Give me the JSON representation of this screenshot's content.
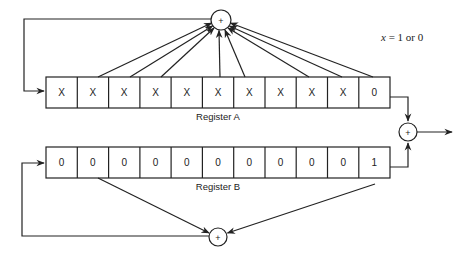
{
  "diagram": {
    "legend": {
      "variable": "x",
      "text": " = 1 or 0"
    },
    "register_a": {
      "label": "Register A",
      "cells": [
        "X",
        "X",
        "X",
        "X",
        "X",
        "X",
        "X",
        "X",
        "X",
        "X",
        "0"
      ]
    },
    "register_b": {
      "label": "Register B",
      "cells": [
        "0",
        "0",
        "0",
        "0",
        "0",
        "0",
        "0",
        "0",
        "0",
        "0",
        "1"
      ]
    },
    "xor_symbol": "+",
    "nodes": {
      "xor_top": "+",
      "xor_output": "+",
      "xor_bottom": "+"
    }
  }
}
